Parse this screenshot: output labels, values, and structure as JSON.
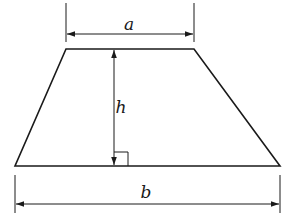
{
  "diagram": {
    "shape": "trapezoid",
    "labels": {
      "top_base": "a",
      "height": "h",
      "bottom_base": "b"
    },
    "annotations": [
      "right-angle marker at foot of height"
    ],
    "colors": {
      "stroke": "#1a1a1a",
      "background": "#ffffff"
    }
  }
}
